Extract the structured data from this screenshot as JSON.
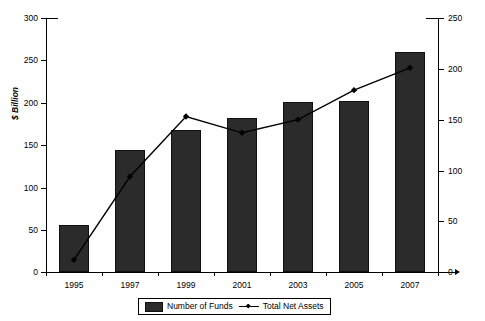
{
  "chart_data": {
    "type": "bar",
    "title": "",
    "subtitle": "",
    "xlabel": "",
    "ylabel": "$ Billion",
    "y2label": "",
    "categories": [
      "1995",
      "1997",
      "1999",
      "2001",
      "2003",
      "2005",
      "2007"
    ],
    "ylim": [
      0,
      300
    ],
    "y2lim": [
      0,
      250
    ],
    "yticks": [
      0,
      50,
      100,
      150,
      200,
      250,
      300
    ],
    "y2ticks": [
      0,
      50,
      100,
      150,
      200,
      250
    ],
    "grid": false,
    "legend_position": "bottom-center",
    "series": [
      {
        "name": "Number of Funds",
        "type": "bar",
        "axis": "left",
        "color": "#2b2b2b",
        "values": [
          55,
          144,
          168,
          182,
          201,
          202,
          260
        ]
      },
      {
        "name": "Total Net Assets",
        "type": "line",
        "axis": "right",
        "color": "#000000",
        "marker": "diamond",
        "values": [
          12,
          94,
          153,
          137,
          150,
          179,
          201
        ]
      }
    ]
  },
  "axes": {
    "left_tick_labels": [
      "300",
      "250",
      "200",
      "150",
      "100",
      "50",
      "0"
    ],
    "right_tick_labels": [
      "250",
      "200",
      "150",
      "100",
      "50",
      "0"
    ],
    "y_axis_title": "$ Billion"
  },
  "legend": {
    "items": [
      {
        "label": "Number of Funds",
        "marker": "bar-swatch"
      },
      {
        "label": "Total Net Assets",
        "marker": "line-diamond-swatch"
      }
    ]
  }
}
